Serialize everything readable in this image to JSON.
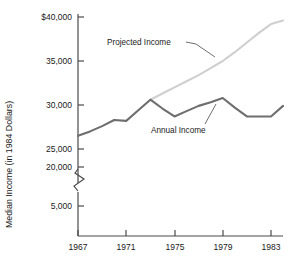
{
  "chart_data": {
    "type": "line",
    "title": "",
    "xlabel": "",
    "ylabel": "Median Income (in 1984 Dollars)",
    "grid": false,
    "legend_position": "inline-annotations",
    "axis_break": {
      "present": true,
      "between": [
        5000,
        20000
      ],
      "symbol": "zigzag"
    },
    "xlim": [
      1967,
      1984
    ],
    "ylim": [
      20000,
      40000
    ],
    "y_ticks": [
      "$40,000",
      "35,000",
      "30,000",
      "25,000",
      "20,000",
      "5,000"
    ],
    "y_tick_values": [
      40000,
      35000,
      30000,
      25000,
      20000,
      5000
    ],
    "x_ticks": [
      "1967",
      "1971",
      "1975",
      "1979",
      "1983"
    ],
    "x_tick_values": [
      1967,
      1971,
      1975,
      1979,
      1983
    ],
    "x": [
      1967,
      1968,
      1969,
      1970,
      1971,
      1972,
      1973,
      1974,
      1975,
      1976,
      1977,
      1978,
      1979,
      1980,
      1981,
      1982,
      1983,
      1984
    ],
    "series": [
      {
        "name": "Annual Income",
        "color": "#6e6e6e",
        "values": [
          26500,
          27000,
          27600,
          28300,
          28200,
          29400,
          30600,
          29600,
          28700,
          29300,
          29900,
          30300,
          30800,
          29700,
          28700,
          28700,
          28700,
          29900
        ]
      },
      {
        "name": "Projected Income",
        "color": "#cfcfcf",
        "values": [
          null,
          null,
          null,
          null,
          null,
          null,
          30600,
          31300,
          32000,
          32700,
          33400,
          34200,
          35000,
          36000,
          37100,
          38200,
          39200,
          39600
        ]
      }
    ],
    "annotations": [
      {
        "text": "Projected Income",
        "id": "projected-income-label"
      },
      {
        "text": "Annual Income",
        "id": "annual-income-label"
      }
    ]
  }
}
